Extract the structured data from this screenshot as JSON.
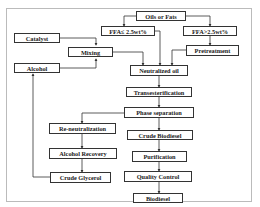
{
  "diagram": {
    "nodes": {
      "oils_fats": "Oils or Fats",
      "ffa_low": "FFA≤ 2.5wt%",
      "ffa_high": "FFA>2.5wt%",
      "catalyst": "Catalyst",
      "mixing": "Mixing",
      "pretreatment": "Pretreatment",
      "alcohol": "Alcohol",
      "neutralized_oil": "Neutralized oil",
      "transesterification": "Transesterification",
      "phase_separation": "Phase separation",
      "re_neutralization": "Re-neutralization",
      "crude_biodiesel": "Crude Biodiesel",
      "alcohol_recovery": "Alcohol Recovery",
      "purification": "Purification",
      "crude_glycerol": "Crude Glycerol",
      "quality_control": "Quality Control",
      "biodiesel": "Biodiesel"
    },
    "edges": [
      [
        "oils_fats",
        "ffa_low"
      ],
      [
        "oils_fats",
        "ffa_high"
      ],
      [
        "ffa_high",
        "pretreatment"
      ],
      [
        "catalyst",
        "mixing"
      ],
      [
        "alcohol",
        "mixing"
      ],
      [
        "ffa_low",
        "neutralized_oil"
      ],
      [
        "mixing",
        "neutralized_oil"
      ],
      [
        "pretreatment",
        "neutralized_oil"
      ],
      [
        "neutralized_oil",
        "transesterification"
      ],
      [
        "transesterification",
        "phase_separation"
      ],
      [
        "phase_separation",
        "re_neutralization"
      ],
      [
        "phase_separation",
        "crude_biodiesel"
      ],
      [
        "re_neutralization",
        "alcohol_recovery"
      ],
      [
        "alcohol_recovery",
        "crude_glycerol"
      ],
      [
        "crude_glycerol",
        "alcohol"
      ],
      [
        "crude_biodiesel",
        "purification"
      ],
      [
        "purification",
        "quality_control"
      ],
      [
        "quality_control",
        "biodiesel"
      ]
    ]
  }
}
